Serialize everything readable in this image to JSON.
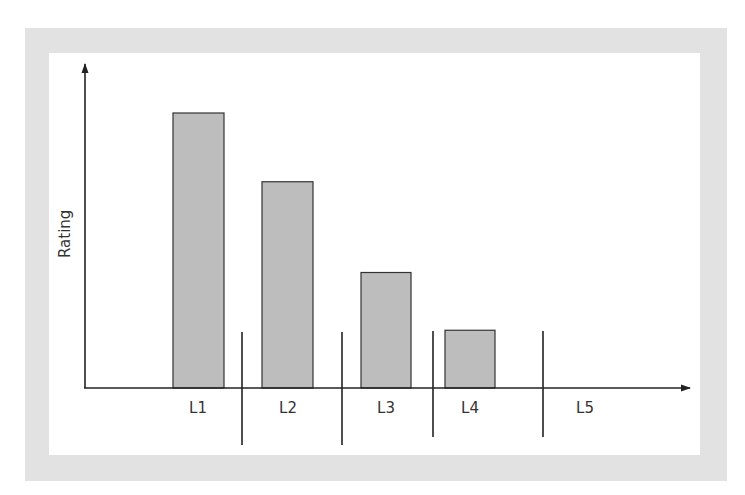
{
  "chart_data": {
    "type": "bar",
    "title": "",
    "xlabel": "",
    "ylabel": "Rating",
    "categories": [
      "L1",
      "L2",
      "L3",
      "L4",
      "L5"
    ],
    "values": [
      100,
      75,
      42,
      21,
      0
    ],
    "ylim": [
      0,
      110
    ],
    "grid": false,
    "legend": null,
    "annotations": [
      "vertical divider lines separate category groups between L1|L2, L2|L3, L3|L4, L4|L5"
    ],
    "bar_color": "#bdbdbd",
    "axis_color": "#222222"
  },
  "labels": {
    "y_axis": "Rating",
    "x": [
      "L1",
      "L2",
      "L3",
      "L4",
      "L5"
    ]
  }
}
